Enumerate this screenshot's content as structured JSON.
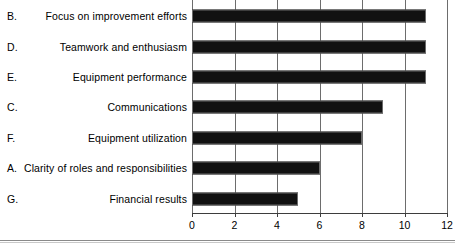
{
  "chart_data": {
    "type": "bar",
    "orientation": "horizontal",
    "title": "",
    "xlabel": "",
    "ylabel": "",
    "xlim": [
      0,
      12
    ],
    "xticks": [
      0,
      2,
      4,
      6,
      8,
      10,
      12
    ],
    "xtick_labels": [
      "0",
      "2",
      "4",
      "6",
      "8",
      "10",
      "12"
    ],
    "grid": "vertical",
    "legend": "none",
    "bar_color": "#111111",
    "categories": [
      "Focus on improvement efforts",
      "Teamwork and enthusiasm",
      "Equipment performance",
      "Communications",
      "Equipment utilization",
      "Clarity of roles and responsibilities",
      "Financial results"
    ],
    "category_keys": [
      "B.",
      "D.",
      "E.",
      "C.",
      "F.",
      "A.",
      "G."
    ],
    "values": [
      11,
      11,
      11,
      9,
      8,
      6,
      5
    ]
  },
  "rows": [
    {
      "key": "B.",
      "label": "Focus on improvement efforts",
      "value": 11
    },
    {
      "key": "D.",
      "label": "Teamwork and enthusiasm",
      "value": 11
    },
    {
      "key": "E.",
      "label": "Equipment performance",
      "value": 11
    },
    {
      "key": "C.",
      "label": "Communications",
      "value": 9
    },
    {
      "key": "F.",
      "label": "Equipment utilization",
      "value": 8
    },
    {
      "key": "A.",
      "label": "Clarity of roles and responsibilities",
      "value": 6
    },
    {
      "key": "G.",
      "label": "Financial results",
      "value": 5
    }
  ],
  "axis": {
    "ticks": [
      "0",
      "2",
      "4",
      "6",
      "8",
      "10",
      "12"
    ]
  }
}
